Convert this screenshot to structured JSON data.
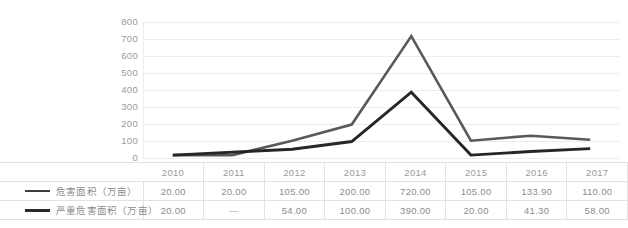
{
  "chart_data": {
    "type": "line",
    "title": "",
    "xlabel": "",
    "ylabel": "",
    "categories": [
      "2010",
      "2011",
      "2012",
      "2013",
      "2014",
      "2015",
      "2016",
      "2017"
    ],
    "ylim": [
      0,
      800
    ],
    "yticks": [
      0,
      100,
      200,
      300,
      400,
      500,
      600,
      700,
      800
    ],
    "ytick_labels": [
      "0",
      "100",
      "200",
      "300",
      "400",
      "500",
      "600",
      "700",
      "800"
    ],
    "grid": true,
    "legend_position": "table-left",
    "series": [
      {
        "name": "危害面积（万亩）",
        "color": "#595959",
        "values": [
          20.0,
          20.0,
          105.0,
          200.0,
          720.0,
          105.0,
          133.9,
          110.0
        ],
        "value_labels": [
          "20.00",
          "20.00",
          "105.00",
          "200.00",
          "720.00",
          "105.00",
          "133.90",
          "110.00"
        ]
      },
      {
        "name": "严重危害面积（万亩）",
        "color": "#262626",
        "values": [
          20.0,
          null,
          54.0,
          100.0,
          390.0,
          20.0,
          41.3,
          58.0
        ],
        "value_labels": [
          "20.00",
          "—",
          "54.00",
          "100.00",
          "390.00",
          "20.00",
          "41.30",
          "58.00"
        ]
      }
    ]
  },
  "table": {
    "header_corner": "",
    "year_headers": [
      "2010",
      "2011",
      "2012",
      "2013",
      "2014",
      "2015",
      "2016",
      "2017"
    ],
    "rows": [
      {
        "legend_label": "危害面积（万亩）",
        "series_color": "#3f3f3f",
        "values": [
          "20.00",
          "20.00",
          "105.00",
          "200.00",
          "720.00",
          "105.00",
          "133.90",
          "110.00"
        ]
      },
      {
        "legend_label": "严重危害面积（万亩）",
        "series_color": "#262626",
        "values": [
          "20.00",
          "—",
          "54.00",
          "100.00",
          "390.00",
          "20.00",
          "41.30",
          "58.00"
        ]
      }
    ]
  },
  "axis": {
    "y_labels": [
      "800",
      "700",
      "600",
      "500",
      "400",
      "300",
      "200",
      "100",
      "0"
    ]
  },
  "colors": {
    "gridline": "#ededed",
    "series1": "#595959",
    "series2": "#262626",
    "text": "#8c8c8c",
    "border": "#e2e2e2",
    "background": "#ffffff"
  }
}
